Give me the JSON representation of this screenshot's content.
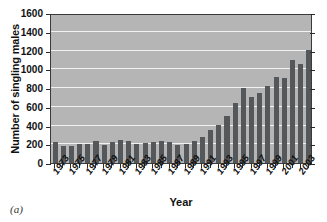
{
  "caption": "(a)",
  "chart_data": {
    "type": "bar",
    "title": "",
    "xlabel": "Year",
    "ylabel": "Number of singling males",
    "ylim": [
      0,
      1600
    ],
    "ytick_step": 200,
    "yticks": [
      0,
      200,
      400,
      600,
      800,
      1000,
      1200,
      1400,
      1600
    ],
    "ytick_labels": [
      "0",
      "200",
      "400",
      "600",
      "800",
      "1000",
      "1200",
      "1400",
      "1600"
    ],
    "grid": "horizontal",
    "legend": "none",
    "bar_color": "#55585a",
    "plot_background": "#b5b5b5",
    "gridline_color": "#f2f2f2",
    "axis_color": "#2b2b2b",
    "categories": [
      "1973",
      "1974",
      "1975",
      "1976",
      "1977",
      "1978",
      "1979",
      "1980",
      "1981",
      "1982",
      "1983",
      "1984",
      "1985",
      "1986",
      "1987",
      "1988",
      "1989",
      "1990",
      "1991",
      "1992",
      "1993",
      "1994",
      "1995",
      "1996",
      "1997",
      "1998",
      "1999",
      "2000",
      "2001",
      "2002",
      "2003",
      "2004"
    ],
    "xtick_labels_shown": [
      "1973",
      "1975",
      "1977",
      "1979",
      "1981",
      "1983",
      "1985",
      "1987",
      "1989",
      "1991",
      "1993",
      "1995",
      "1997",
      "1999",
      "2001",
      "2003"
    ],
    "values": [
      220,
      180,
      185,
      200,
      205,
      230,
      195,
      220,
      245,
      235,
      205,
      210,
      220,
      235,
      225,
      190,
      205,
      230,
      280,
      355,
      405,
      500,
      645,
      795,
      700,
      745,
      825,
      920,
      910,
      1095,
      1055,
      1210
    ],
    "last_value": 1350,
    "note_values_include_final_year": true
  }
}
